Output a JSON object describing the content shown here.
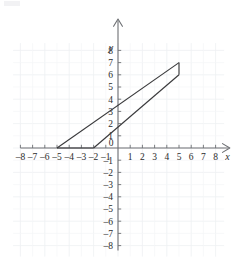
{
  "chart_data": {
    "type": "line",
    "title": "",
    "xlabel": "x",
    "ylabel": "y",
    "xlim": [
      -8,
      8
    ],
    "ylim": [
      -8,
      8
    ],
    "grid": true,
    "legend": "none",
    "x_ticks": [
      -8,
      -7,
      -6,
      -5,
      -4,
      -3,
      -2,
      -1,
      1,
      2,
      3,
      4,
      5,
      6,
      7,
      8
    ],
    "y_ticks": [
      8,
      7,
      6,
      5,
      4,
      3,
      2,
      1,
      -1,
      -2,
      -3,
      -4,
      -5,
      -6,
      -7,
      -8
    ],
    "x_tick_labels": [
      "-8",
      "-7",
      "-6",
      "-5",
      "-4",
      "-3",
      "-2",
      "-1",
      "1",
      "2",
      "3",
      "4",
      "5",
      "6",
      "7",
      "8"
    ],
    "y_tick_labels": [
      "8",
      "7",
      "6",
      "5",
      "4",
      "3",
      "2",
      "1",
      "-1",
      "-2",
      "-3",
      "-4",
      "-5",
      "-6",
      "-7",
      "-8"
    ],
    "origin_label": "0",
    "series": [
      {
        "name": "upper-line",
        "description": "Line from (-5, 0) through y-intercept (0, 3.5) to (5, 7)",
        "points": [
          [
            -5,
            0
          ],
          [
            5,
            7
          ]
        ],
        "slope": 0.7,
        "y_intercept": 3.5,
        "x_intercept": -5
      },
      {
        "name": "lower-line",
        "description": "Line from (-2, 0) through y-intercept (0, 1.7) to (5, 6)",
        "points": [
          [
            -2,
            0
          ],
          [
            5,
            6
          ]
        ],
        "slope": 0.857,
        "y_intercept": 1.7,
        "x_intercept": -2
      },
      {
        "name": "right-edge",
        "description": "Short vertical segment joining the two lines at x = 5",
        "points": [
          [
            5,
            6
          ],
          [
            5,
            7
          ]
        ]
      },
      {
        "name": "bottom-edge",
        "description": "Segment along the x-axis joining the two x-intercepts",
        "points": [
          [
            -5,
            0
          ],
          [
            -2,
            0
          ]
        ]
      }
    ],
    "shape": {
      "name": "quadrilateral",
      "vertices": [
        [
          -5,
          0
        ],
        [
          5,
          7
        ],
        [
          5,
          6
        ],
        [
          -2,
          0
        ]
      ]
    }
  },
  "axes": {
    "x_axis_name": "x",
    "y_axis_name": "y",
    "origin": "0"
  }
}
